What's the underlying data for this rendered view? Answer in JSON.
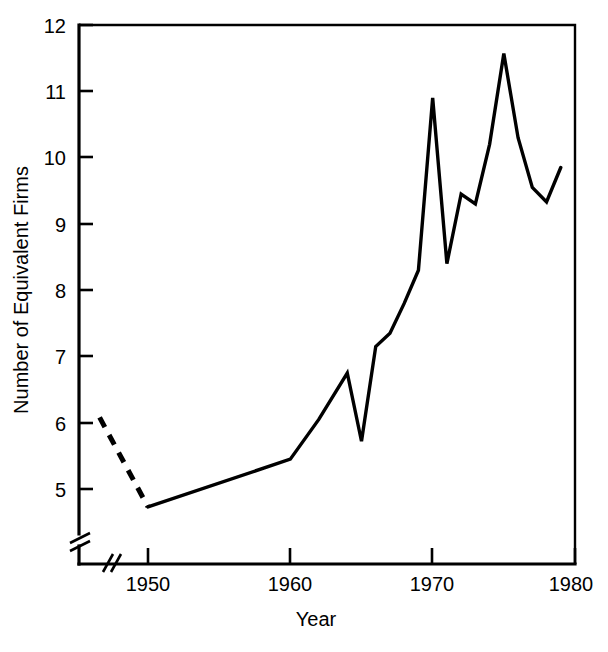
{
  "chart_data": {
    "type": "line",
    "title": "",
    "xlabel": "Year",
    "ylabel": "Number of Equivalent Firms",
    "xlim": [
      1946,
      1980
    ],
    "ylim": [
      4.55,
      12
    ],
    "grid": false,
    "legend": false,
    "axis_break_x": true,
    "axis_break_y": true,
    "y_ticks": [
      5,
      6,
      7,
      8,
      9,
      10,
      11,
      12
    ],
    "y_tick_labels": [
      "5",
      "6",
      "7",
      "8",
      "9",
      "10",
      "11",
      "12"
    ],
    "x_ticks": [
      1950,
      1960,
      1970,
      1980
    ],
    "x_tick_labels": [
      "1950",
      "1960",
      "1970",
      "1980"
    ],
    "series": [
      {
        "name": "Number of Equivalent Firms",
        "style": "dashed",
        "x": [
          1946.6,
          1950
        ],
        "values": [
          6.08,
          4.73
        ]
      },
      {
        "name": "Number of Equivalent Firms",
        "style": "solid",
        "x": [
          1950,
          1960,
          1962,
          1964,
          1965,
          1966,
          1967,
          1968,
          1969,
          1970,
          1971,
          1972,
          1973,
          1974,
          1975,
          1976,
          1977,
          1978,
          1979
        ],
        "values": [
          4.73,
          5.45,
          6.05,
          6.75,
          5.72,
          7.15,
          7.35,
          7.8,
          8.3,
          10.9,
          8.4,
          9.45,
          9.3,
          10.2,
          11.57,
          10.3,
          9.55,
          9.33,
          9.85
        ]
      }
    ]
  },
  "axes": {
    "y_title": "Number of Equivalent Firms",
    "x_title": "Year",
    "y_tick_labels": [
      "12",
      "11",
      "10",
      "9",
      "8",
      "7",
      "6",
      "5"
    ],
    "x_tick_labels": [
      "1950",
      "1960",
      "1970",
      "1980"
    ]
  }
}
